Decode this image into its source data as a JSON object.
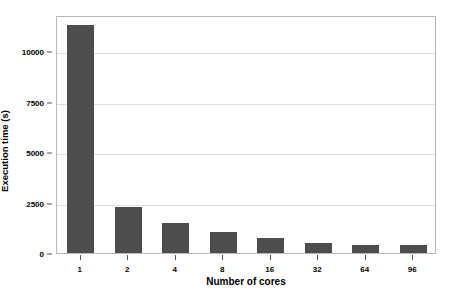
{
  "chart_data": {
    "type": "bar",
    "title": "",
    "subtitle": "",
    "xlabel": "Number of cores",
    "ylabel": "Execution time (s)",
    "categories": [
      "1",
      "2",
      "4",
      "8",
      "16",
      "32",
      "64",
      "96"
    ],
    "values": [
      11300,
      2300,
      1500,
      1050,
      730,
      520,
      420,
      420
    ],
    "series": [
      {
        "name": "Execution time",
        "values": [
          11300,
          2300,
          1500,
          1050,
          730,
          520,
          420,
          420
        ]
      }
    ],
    "ylim": [
      0,
      11800
    ],
    "yticks": [
      0,
      2500,
      5000,
      7500,
      10000
    ],
    "ytick_labels": [
      "0",
      "2500",
      "5000",
      "7500",
      "10000"
    ],
    "xtick_labels": [
      "1",
      "2",
      "4",
      "8",
      "16",
      "32",
      "64",
      "96"
    ],
    "grid": "horizontal",
    "legend": "none",
    "bar_color": "#4d4d4d",
    "grid_color": "#dedede",
    "frame_color": "#b9b9b9",
    "background": "#ffffff"
  }
}
